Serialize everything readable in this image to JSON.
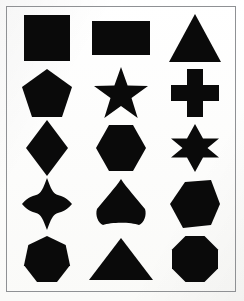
{
  "page": {
    "background_color": "#fdfdfc",
    "shape_color": "#0a0a0a",
    "frame_color": "#8f9194",
    "columns": 3,
    "rows": 5,
    "shape_count": 15
  },
  "shapes": [
    {
      "name": "square",
      "label": "Square",
      "row": 1,
      "col": 1,
      "sides": 4,
      "size_w": 46,
      "size_h": 46
    },
    {
      "name": "rectangle",
      "label": "Rectangle",
      "row": 1,
      "col": 2,
      "sides": 4,
      "size_w": 58,
      "size_h": 34
    },
    {
      "name": "triangle-tall",
      "label": "Triangle",
      "row": 1,
      "col": 3,
      "sides": 3,
      "size_w": 52,
      "size_h": 48
    },
    {
      "name": "pentagon",
      "label": "Pentagon",
      "row": 2,
      "col": 1,
      "sides": 5,
      "size_w": 50,
      "size_h": 48
    },
    {
      "name": "star-5-point",
      "label": "Five-Pointed Star",
      "row": 2,
      "col": 2,
      "sides": 5,
      "size_w": 54,
      "size_h": 52
    },
    {
      "name": "cross-greek",
      "label": "Greek Cross",
      "row": 2,
      "col": 3,
      "sides": 12,
      "size_w": 48,
      "size_h": 48
    },
    {
      "name": "diamond",
      "label": "Diamond",
      "row": 3,
      "col": 1,
      "sides": 4,
      "size_w": 42,
      "size_h": 56
    },
    {
      "name": "hexagon-flat-top",
      "label": "Hexagon",
      "row": 3,
      "col": 2,
      "sides": 6,
      "size_w": 50,
      "size_h": 46
    },
    {
      "name": "star-6-point",
      "label": "Six-Pointed Star",
      "row": 3,
      "col": 3,
      "sides": 6,
      "size_w": 48,
      "size_h": 48
    },
    {
      "name": "star-4-point",
      "label": "Four-Pointed Star",
      "row": 4,
      "col": 1,
      "sides": 4,
      "size_w": 50,
      "size_h": 52
    },
    {
      "name": "triangle-rounded",
      "label": "Rounded Triangle",
      "row": 4,
      "col": 2,
      "sides": 3,
      "size_w": 52,
      "size_h": 50
    },
    {
      "name": "hexagon-irregular",
      "label": "Irregular Hexagon",
      "row": 4,
      "col": 3,
      "sides": 6,
      "size_w": 50,
      "size_h": 48
    },
    {
      "name": "heptagon",
      "label": "Heptagon",
      "row": 5,
      "col": 1,
      "sides": 7,
      "size_w": 46,
      "size_h": 46
    },
    {
      "name": "triangle-wide",
      "label": "Wide Triangle",
      "row": 5,
      "col": 2,
      "sides": 3,
      "size_w": 64,
      "size_h": 42
    },
    {
      "name": "octagon",
      "label": "Octagon",
      "row": 5,
      "col": 3,
      "sides": 8,
      "size_w": 46,
      "size_h": 46
    }
  ]
}
